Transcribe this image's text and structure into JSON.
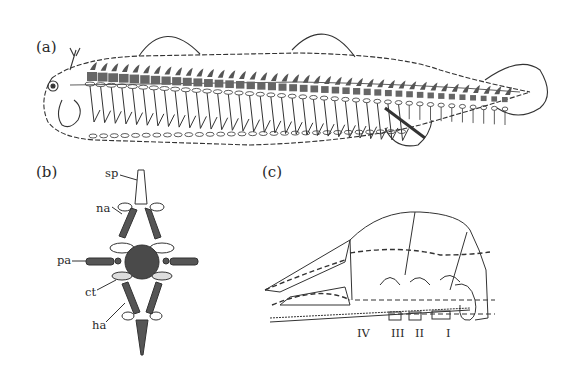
{
  "figure": {
    "panels": [
      {
        "id": "a",
        "label": "(a)",
        "description": "Lateral view of a fish-like vertebrate showing the axial skeleton: dark dorsal neural elements, segmented vertebrae, ribs along the trunk, dorsal fins, ventral fin, and tail fin."
      },
      {
        "id": "b",
        "label": "(b)",
        "description": "Cross-section of a vertebra with labeled parts.",
        "annotations": [
          {
            "key": "sp",
            "text": "sp"
          },
          {
            "key": "na",
            "text": "na"
          },
          {
            "key": "pa",
            "text": "pa"
          },
          {
            "key": "ct",
            "text": "ct"
          },
          {
            "key": "ha",
            "text": "ha"
          }
        ]
      },
      {
        "id": "c",
        "label": "(c)",
        "description": "Lateral view of the skull with dashed lines and numbered vertebral segments.",
        "segments": [
          "IV",
          "III",
          "II",
          "I"
        ]
      }
    ]
  }
}
